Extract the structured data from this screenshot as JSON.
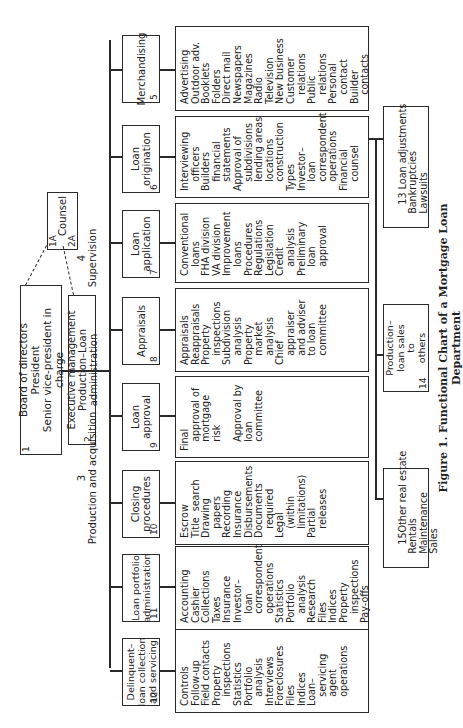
{
  "top": {
    "board": {
      "num": "1",
      "lines": [
        "Board of directors",
        "President",
        "Senior vice-president in charge"
      ]
    },
    "executive": {
      "num": "2",
      "lines": [
        "Executive management",
        "Production–Loan administration"
      ]
    },
    "counsel": {
      "num_a": "1A",
      "num_b": "2A",
      "label": "Counsel"
    }
  },
  "groups": {
    "production": {
      "num": "3",
      "label": "Production and acquisition"
    },
    "supervision": {
      "num": "4",
      "label": "Supervision"
    }
  },
  "units": [
    {
      "num": "5",
      "title": "Merchandising",
      "details": "Advertising\nOutdoor adv.\nBooklets\nFolders\nDirect mail\nNewspapers\nMagazines\nRadio\nTelevision\nNew business\nCustomer\n   relations\nPublic\n   relations\nPersonal\n   contact\nBuilder\n   contacts"
    },
    {
      "num": "6",
      "title": "Loan\norigination",
      "details": "Interviewing\n   officers\nBuilders\n   financial\n   statements\nApproval of\n   subdivisions\n   lending areas\n   locations\n   construction\nTypes\nInvestor–\n   loan\n   correspondent\n   operations\nFinancial\n   counsel"
    },
    {
      "num": "7",
      "title": "Loan\napplication",
      "details": "Conventional\n   loans\nFHA division\nVA division\nImprovement\n   loans\nProcedures\nRegulations\nLegislation\nCredit\n   analysis\nPreliminary\n   loan\n   approval"
    },
    {
      "num": "8",
      "title": "Appraisals",
      "details": "Appraisals\nReappraisals\nProperty\n   inspections\nSubdivision\n   analysis\nProperty\n   market\n   analysis\nChief\n   appraiser\n   and adviser\n   to loan\n   committee"
    },
    {
      "num": "9",
      "title": "Loan\napproval",
      "details": "Final\n   approval of\n   mortgage\n   risk\n\n   Approval by\n   loan\n   committee"
    },
    {
      "num": "10",
      "title": "Closing\nprocedures",
      "details": "Escrow\nTitle  search\nDrawing\n   papers\nRecording\nInsurance\nDisbursements\nDocuments\n   required\nLegal\n   (within\n   limitations)\nPartial\n   releases"
    },
    {
      "num": "11",
      "title": "Loan portfolio\nadministration",
      "details": "Accounting\nCashier\nCollections\nTaxes\nInsurance\nInvestor–\n   loan\n   correspondent\n   operations\nStatistics\nPortfolio\n   analysis\nResearch\nFiles\nIndices\nProperty\n   inspections\nPay-offs"
    },
    {
      "num": "12",
      "title": "Delinquent–\nloan collection\nand servicing",
      "details": "Controls\nFollow-up\nField contacts\nProperty\n   inspections\nStatistics\nPortfolio\n   analysis\nInterviews\nForeclosures\nFiles\nIndices\nLoan–\n   servicing\n   agent\n   operations"
    }
  ],
  "subunits": [
    {
      "num": "13",
      "lines": "Loan adjustments\n   Bankruptcies\n   Lawsuits"
    },
    {
      "num": "14",
      "lines": "Production–\nloan sales\nto\nothers"
    },
    {
      "num": "15",
      "lines": "Other real estate\n   Rentals\n   Maintenance\n   Sales"
    }
  ],
  "caption": "Figure 1. Functional Chart of a Mortgage Loan Department"
}
